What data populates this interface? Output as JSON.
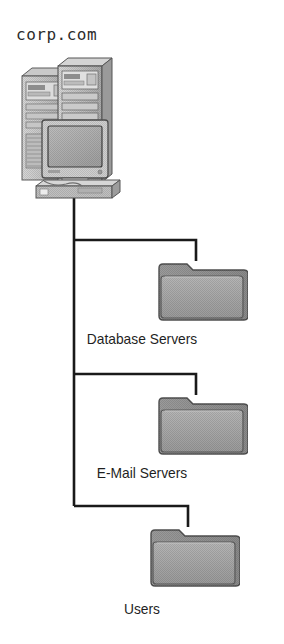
{
  "diagram": {
    "title": "corp.com",
    "type": "network-tree",
    "root": {
      "label": "corp.com",
      "icon": "server-computer-icon"
    },
    "nodes": [
      {
        "id": "database-servers",
        "label": "Database Servers",
        "icon": "folder-icon"
      },
      {
        "id": "email-servers",
        "label": "E-Mail Servers",
        "icon": "folder-icon"
      },
      {
        "id": "users",
        "label": "Users",
        "icon": "folder-icon"
      }
    ],
    "connector": {
      "style": "orthogonal-elbow",
      "color": "#1a1a1a"
    },
    "colors": {
      "background": "#ffffff",
      "line": "#1a1a1a",
      "text": "#1f1f1f",
      "folder_front": "#a8a8a8",
      "folder_back": "#8e8e8e",
      "folder_outline": "#4a4a4a",
      "chassis_light": "#d2d2d2",
      "chassis_mid": "#b4b4b4",
      "chassis_dark": "#8a8a8a",
      "screen": "#b0b0b0"
    }
  }
}
